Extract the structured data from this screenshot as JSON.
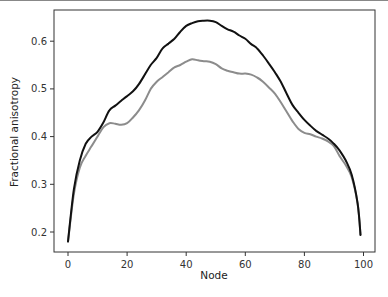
{
  "chart_data": {
    "type": "line",
    "title": "",
    "xlabel": "Node",
    "ylabel": "Fractional anisotropy",
    "xlim": [
      -4,
      104
    ],
    "ylim": [
      0.16,
      0.665
    ],
    "x_ticks": [
      0,
      20,
      40,
      60,
      80,
      100
    ],
    "x_tick_labels": [
      "0",
      "20",
      "40",
      "60",
      "80",
      "100"
    ],
    "y_ticks": [
      0.2,
      0.3,
      0.4,
      0.5,
      0.6
    ],
    "y_tick_labels": [
      "0.2",
      "0.3",
      "0.4",
      "0.5",
      "0.6"
    ],
    "grid": false,
    "legend": null,
    "x": [
      0,
      2,
      4,
      6,
      8,
      10,
      12,
      14,
      16,
      18,
      20,
      22,
      24,
      26,
      28,
      30,
      32,
      34,
      36,
      38,
      40,
      42,
      44,
      46,
      48,
      50,
      52,
      54,
      56,
      58,
      60,
      62,
      64,
      66,
      68,
      70,
      72,
      74,
      76,
      78,
      80,
      82,
      84,
      86,
      88,
      90,
      92,
      94,
      96,
      98,
      99
    ],
    "series": [
      {
        "name": "series-black",
        "color": "#111111",
        "values": [
          0.18,
          0.29,
          0.35,
          0.385,
          0.4,
          0.41,
          0.43,
          0.455,
          0.465,
          0.475,
          0.485,
          0.495,
          0.51,
          0.53,
          0.55,
          0.565,
          0.585,
          0.595,
          0.605,
          0.62,
          0.632,
          0.638,
          0.642,
          0.643,
          0.643,
          0.64,
          0.632,
          0.625,
          0.62,
          0.612,
          0.605,
          0.594,
          0.585,
          0.57,
          0.553,
          0.535,
          0.515,
          0.49,
          0.466,
          0.45,
          0.435,
          0.423,
          0.412,
          0.404,
          0.396,
          0.385,
          0.37,
          0.35,
          0.32,
          0.26,
          0.194
        ]
      },
      {
        "name": "series-grey",
        "color": "#8c8c8c",
        "values": [
          0.18,
          0.28,
          0.335,
          0.36,
          0.38,
          0.4,
          0.42,
          0.428,
          0.427,
          0.425,
          0.428,
          0.44,
          0.455,
          0.475,
          0.5,
          0.515,
          0.525,
          0.535,
          0.545,
          0.55,
          0.557,
          0.562,
          0.56,
          0.558,
          0.557,
          0.552,
          0.543,
          0.538,
          0.535,
          0.532,
          0.532,
          0.53,
          0.524,
          0.515,
          0.503,
          0.49,
          0.472,
          0.452,
          0.432,
          0.416,
          0.408,
          0.405,
          0.4,
          0.396,
          0.39,
          0.38,
          0.358,
          0.34,
          0.315,
          0.26,
          0.194
        ]
      }
    ]
  },
  "axes": {
    "xlabel": "Node",
    "ylabel": "Fractional anisotropy"
  },
  "layout": {
    "plot_left": 54,
    "plot_top": 10,
    "plot_right": 375,
    "plot_bottom": 252,
    "x0_px": 68,
    "x_px_per_unit": 2.955,
    "y02_px": 232,
    "y_px_per_unit": 477
  }
}
